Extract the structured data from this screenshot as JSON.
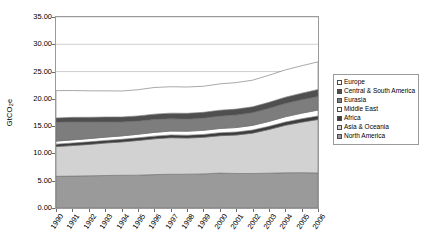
{
  "chart_data": {
    "type": "area",
    "title": "",
    "xlabel": "",
    "ylabel": "GtCO2e",
    "ylabel_parts": {
      "pre": "GtCO",
      "sub": "2",
      "post": "e"
    },
    "ylim": [
      0,
      35
    ],
    "ytick_step": 5,
    "ytick_labels": [
      "35.00",
      "30.00",
      "25.00",
      "20.00",
      "15.00",
      "10.00",
      "5.00",
      "0.00"
    ],
    "ytick_values": [
      35,
      30,
      25,
      20,
      15,
      10,
      5,
      0
    ],
    "grid": true,
    "grid_axis": "y",
    "stacked": true,
    "stack_order_bottom_to_top": [
      "North America",
      "Asia & Oceania",
      "Africa",
      "Middle East",
      "Eurasia",
      "Central & South America",
      "Europe"
    ],
    "legend_position": "right",
    "categories": [
      1990,
      1991,
      1992,
      1993,
      1994,
      1995,
      1996,
      1997,
      1998,
      1999,
      2000,
      2001,
      2002,
      2003,
      2004,
      2005,
      2006
    ],
    "xtick_labels": [
      "1990",
      "1991",
      "1992",
      "1993",
      "1994",
      "1995",
      "1996",
      "1997",
      "1998",
      "1999",
      "2000",
      "2001",
      "2002",
      "2003",
      "2004",
      "2005",
      "2006"
    ],
    "series": [
      {
        "name": "North America",
        "color": "#9a9a9a",
        "values": [
          5.8,
          5.85,
          5.9,
          5.95,
          6.0,
          6.02,
          6.12,
          6.18,
          6.2,
          6.25,
          6.4,
          6.32,
          6.32,
          6.38,
          6.45,
          6.48,
          6.42
        ]
      },
      {
        "name": "Asia & Oceania",
        "color": "#d2d2d2",
        "values": [
          5.45,
          5.6,
          5.75,
          5.95,
          6.1,
          6.35,
          6.55,
          6.7,
          6.62,
          6.7,
          6.85,
          7.05,
          7.4,
          8.0,
          8.7,
          9.25,
          9.8
        ]
      },
      {
        "name": "Africa",
        "color": "#3c3c3c",
        "values": [
          0.45,
          0.46,
          0.47,
          0.47,
          0.48,
          0.49,
          0.5,
          0.51,
          0.52,
          0.53,
          0.54,
          0.55,
          0.56,
          0.58,
          0.6,
          0.62,
          0.64
        ]
      },
      {
        "name": "Middle East",
        "color": "#ffffff",
        "values": [
          0.55,
          0.57,
          0.59,
          0.61,
          0.63,
          0.65,
          0.68,
          0.7,
          0.73,
          0.75,
          0.78,
          0.82,
          0.86,
          0.9,
          0.96,
          1.02,
          1.08
        ]
      },
      {
        "name": "Eurasia",
        "color": "#7d7d7d",
        "values": [
          3.45,
          3.3,
          3.05,
          2.8,
          2.55,
          2.4,
          2.35,
          2.25,
          2.2,
          2.22,
          2.25,
          2.28,
          2.3,
          2.38,
          2.42,
          2.45,
          2.5
        ]
      },
      {
        "name": "Central & South America",
        "color": "#4f4f4f",
        "values": [
          0.8,
          0.83,
          0.86,
          0.89,
          0.92,
          0.96,
          1.0,
          1.04,
          1.08,
          1.08,
          1.1,
          1.1,
          1.1,
          1.12,
          1.17,
          1.22,
          1.28
        ]
      },
      {
        "name": "Europe",
        "color": "#ffffff",
        "values": [
          5.0,
          4.92,
          4.85,
          4.8,
          4.76,
          4.8,
          4.88,
          4.84,
          4.82,
          4.78,
          4.82,
          4.86,
          4.88,
          4.96,
          5.0,
          5.02,
          5.06
        ]
      }
    ]
  },
  "legend": {
    "items": [
      {
        "label": "Europe",
        "color": "#ffffff"
      },
      {
        "label": "Central & South America",
        "color": "#4f4f4f"
      },
      {
        "label": "Eurasia",
        "color": "#7d7d7d"
      },
      {
        "label": "Middle East",
        "color": "#ffffff"
      },
      {
        "label": "Africa",
        "color": "#3c3c3c"
      },
      {
        "label": "Asia & Oceania",
        "color": "#d2d2d2"
      },
      {
        "label": "North America",
        "color": "#9a9a9a"
      }
    ]
  }
}
